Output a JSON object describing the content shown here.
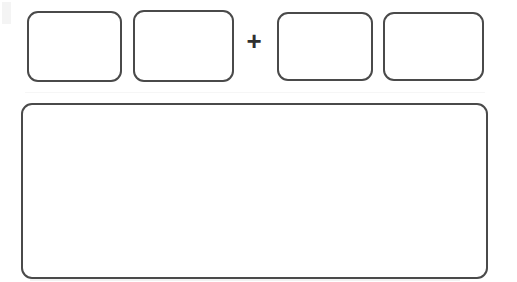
{
  "document": {
    "title": "Blank rounded-box worksheet template",
    "background_color": "#ffffff",
    "stroke_color": "#4a4a4a",
    "width": 517,
    "height": 282
  },
  "top_row": {
    "label": "equation row",
    "boxes": [
      {
        "name": "box-1",
        "content": "",
        "position": 1
      },
      {
        "name": "box-2",
        "content": "",
        "position": 2
      },
      {
        "name": "box-3",
        "content": "",
        "position": 3
      },
      {
        "name": "box-4",
        "content": "",
        "position": 4
      }
    ],
    "operator": {
      "symbol": "+",
      "name": "plus",
      "between_positions": [
        2,
        3
      ]
    }
  },
  "answer_area": {
    "name": "answer-box",
    "content": "",
    "placeholder": ""
  },
  "artifacts": {
    "top_left": "",
    "bottom_row": "",
    "mid_row": ""
  }
}
